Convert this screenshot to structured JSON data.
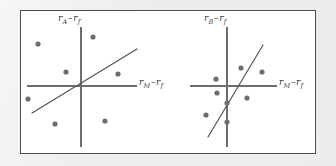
{
  "figure": {
    "background_color": "#ececed",
    "panel_background": "#ffffff",
    "frame_border_color": "#4d4d4d",
    "axis_color": "#6e6e6e",
    "line_color": "#555555",
    "point_color": "#6e6e6e",
    "point_radius": 2.6
  },
  "panels": [
    {
      "id": "panel-a",
      "name": "security-characteristic-line-asset-a",
      "y_axis_label": {
        "symbol": "r",
        "subscript": "A",
        "operator": "–",
        "symbol2": "r",
        "subscript2": "f",
        "text": "rA – rf"
      },
      "x_axis_label": {
        "symbol": "r",
        "subscript": "M",
        "operator": "–",
        "symbol2": "r",
        "subscript2": "f",
        "text": "rM – rf"
      },
      "origin": {
        "x": 81,
        "y": 86
      },
      "axes": {
        "vertical": {
          "x": 81,
          "y_top": 27,
          "y_bottom": 147
        },
        "horizontal": {
          "y": 86,
          "x_left": 27,
          "x_right": 137
        }
      },
      "regression_line": {
        "x1": 32,
        "y1": 113,
        "x2": 137,
        "y2": 49
      }
    },
    {
      "id": "panel-b",
      "name": "security-characteristic-line-asset-b",
      "y_axis_label": {
        "symbol": "r",
        "subscript": "B",
        "operator": "–",
        "symbol2": "r",
        "subscript2": "f",
        "text": "rB – rf"
      },
      "x_axis_label": {
        "symbol": "r",
        "subscript": "M",
        "operator": "–",
        "symbol2": "r",
        "subscript2": "f",
        "text": "rM – rf"
      },
      "origin": {
        "x": 227,
        "y": 86
      },
      "axes": {
        "vertical": {
          "x": 227,
          "y_top": 27,
          "y_bottom": 147
        },
        "horizontal": {
          "y": 86,
          "x_left": 190,
          "x_right": 277
        }
      },
      "regression_line": {
        "x1": 208,
        "y1": 137,
        "x2": 263,
        "y2": 45
      }
    }
  ],
  "chart_data": [
    {
      "type": "scatter",
      "title": "",
      "panel": "panel-a",
      "xlabel": "rM – rf",
      "ylabel": "rA – rf",
      "description": "Widely dispersed excess returns of asset A against market excess returns; shallow regression line, low R-squared, high residual variance.",
      "grid": false,
      "legend": false,
      "xlim": [
        -1,
        1
      ],
      "ylim": [
        -1,
        1
      ],
      "pixel_points": [
        {
          "x": 38,
          "y": 44
        },
        {
          "x": 93,
          "y": 37
        },
        {
          "x": 66,
          "y": 72
        },
        {
          "x": 118,
          "y": 74
        },
        {
          "x": 28,
          "y": 99
        },
        {
          "x": 55,
          "y": 124
        },
        {
          "x": 105,
          "y": 121
        }
      ],
      "data_points": [
        {
          "x": -0.78,
          "y": 0.7
        },
        {
          "x": 0.22,
          "y": 0.82
        },
        {
          "x": -0.27,
          "y": 0.23
        },
        {
          "x": 0.67,
          "y": 0.2
        },
        {
          "x": -0.96,
          "y": -0.22
        },
        {
          "x": -0.47,
          "y": -0.63
        },
        {
          "x": 0.44,
          "y": -0.58
        }
      ]
    },
    {
      "type": "scatter",
      "title": "",
      "panel": "panel-b",
      "xlabel": "rM – rf",
      "ylabel": "rB – rf",
      "description": "Tightly clustered excess returns of asset B against market excess returns; steep regression line, high R-squared, low residual variance.",
      "grid": false,
      "legend": false,
      "xlim": [
        -1,
        1
      ],
      "ylim": [
        -1,
        1
      ],
      "pixel_points": [
        {
          "x": 241,
          "y": 68
        },
        {
          "x": 262,
          "y": 72
        },
        {
          "x": 227,
          "y": 103
        },
        {
          "x": 216,
          "y": 79
        },
        {
          "x": 217,
          "y": 93
        },
        {
          "x": 206,
          "y": 115
        },
        {
          "x": 227,
          "y": 122
        },
        {
          "x": 247,
          "y": 98
        }
      ],
      "data_points": [
        {
          "x": 0.28,
          "y": 0.32
        },
        {
          "x": 0.67,
          "y": 0.25
        },
        {
          "x": 0.0,
          "y": -0.3
        },
        {
          "x": -0.2,
          "y": 0.13
        },
        {
          "x": -0.18,
          "y": -0.12
        },
        {
          "x": -0.39,
          "y": -0.52
        },
        {
          "x": 0.0,
          "y": -0.63
        },
        {
          "x": 0.38,
          "y": -0.21
        }
      ]
    }
  ]
}
